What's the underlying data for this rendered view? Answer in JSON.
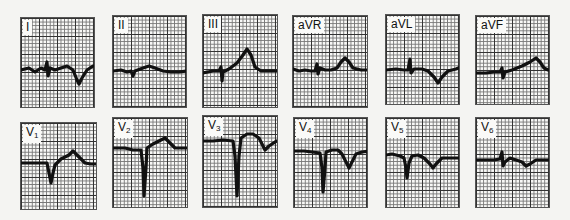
{
  "figure": {
    "leads": [
      {
        "id": "I",
        "label": "I",
        "sub": "",
        "box": [
          20,
          17,
          75,
          91
        ],
        "trace": "M0,52 L8,50 L14,54 L20,50 L24,52 L26,44 L27,58 L29,50 L34,52 L40,50 L46,48 L52,52 L56,62 L58,66 L61,60 L66,52 L72,48 L75,48"
      },
      {
        "id": "II",
        "label": "II",
        "sub": "",
        "box": [
          112,
          15,
          75,
          93
        ],
        "trace": "M0,55 L8,54 L14,56 L18,55 L20,60 L22,55 L30,52 L36,50 L42,52 L50,55 L58,56 L66,56 L75,55"
      },
      {
        "id": "III",
        "label": "III",
        "sub": "",
        "box": [
          202,
          14,
          76,
          94
        ],
        "trace": "M0,58 L10,56 L16,56 L18,52 L19,66 L20,57 L26,54 L34,48 L40,40 L44,34 L48,40 L52,52 L58,56 L66,56 L76,56"
      },
      {
        "id": "aVR",
        "label": "aVR",
        "sub": "",
        "box": [
          292,
          15,
          76,
          93
        ],
        "trace": "M0,53 L6,55 L12,54 L18,55 L22,55 L24,48 L25,58 L27,52 L32,54 L38,54 L44,52 L48,46 L52,42 L56,46 L60,52 L68,54 L76,54"
      },
      {
        "id": "aVL",
        "label": "aVL",
        "sub": "",
        "box": [
          385,
          14,
          75,
          91
        ],
        "trace": "M0,55 L10,54 L18,55 L22,55 L24,44 L25,58 L28,54 L36,54 L42,56 L48,62 L52,68 L56,62 L62,56 L70,54 L75,52"
      },
      {
        "id": "aVF",
        "label": "aVF",
        "sub": "",
        "box": [
          475,
          15,
          75,
          90
        ],
        "trace": "M0,57 L10,57 L18,56 L24,56 L26,52 L27,62 L29,56 L36,54 L46,50 L54,46 L60,42 L64,46 L68,52 L72,54 L75,54"
      }
    ],
    "leads_row2": [
      {
        "id": "V1",
        "label": "V",
        "sub": "1",
        "box": [
          20,
          122,
          77,
          88
        ],
        "trace": "M0,40 L10,40 L20,40 L26,40 L28,50 L30,60 L32,50 L34,42 L40,36 L48,32 L52,28 L58,34 L64,40 L70,41 L77,41"
      },
      {
        "id": "V2",
        "label": "V",
        "sub": "2",
        "box": [
          112,
          117,
          76,
          91
        ],
        "trace": "M0,30 L12,30 L20,32 L28,32 L30,50 L31,78 L33,50 L34,30 L40,26 L48,22 L52,20 L56,24 L62,30 L70,30 L76,30"
      },
      {
        "id": "V3",
        "label": "V",
        "sub": "3",
        "box": [
          202,
          115,
          76,
          93
        ],
        "trace": "M0,25 L10,25 L20,24 L30,25 L32,40 L34,80 L36,40 L38,22 L44,18 L50,18 L56,22 L60,30 L62,34 L66,30 L72,26 L76,24"
      },
      {
        "id": "V4",
        "label": "V",
        "sub": "4",
        "box": [
          293,
          117,
          75,
          91
        ],
        "trace": "M0,33 L10,33 L18,34 L26,35 L28,50 L29,74 L31,50 L32,34 L38,32 L44,32 L48,36 L52,44 L55,50 L58,44 L62,36 L68,34 L75,33"
      },
      {
        "id": "V5",
        "label": "V",
        "sub": "5",
        "box": [
          385,
          117,
          75,
          91
        ],
        "trace": "M0,37 L6,36 L14,38 L18,40 L20,50 L21,60 L23,45 L26,38 L32,37 L38,40 L44,46 L47,50 L50,46 L56,40 L64,40 L75,40"
      },
      {
        "id": "V6",
        "label": "V",
        "sub": "6",
        "box": [
          475,
          117,
          75,
          91
        ],
        "trace": "M0,42 L10,42 L18,42 L24,41 L26,34 L27,48 L29,44 L34,40 L40,42 L46,44 L50,48 L54,46 L60,42 L68,42 L75,42"
      }
    ],
    "colors": {
      "trace": "#111111",
      "grid_major": "#333333",
      "grid_minor": "#777777",
      "paper": "#f8f8f6"
    }
  }
}
